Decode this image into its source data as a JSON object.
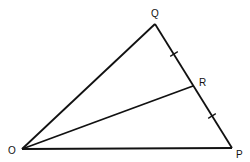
{
  "diagram": {
    "type": "geometry-triangle",
    "colors": {
      "stroke": "#111111",
      "background": "#ffffff"
    },
    "points": {
      "O": {
        "label": "O",
        "x": 22,
        "y": 149,
        "label_x": 8,
        "label_y": 154
      },
      "P": {
        "label": "P",
        "x": 232,
        "y": 148,
        "label_x": 236,
        "label_y": 158
      },
      "Q": {
        "label": "Q",
        "x": 155,
        "y": 24,
        "label_x": 151,
        "label_y": 17
      },
      "R": {
        "label": "R",
        "x": 193,
        "y": 86,
        "label_x": 199,
        "label_y": 86
      }
    },
    "segments": [
      {
        "from": "O",
        "to": "Q"
      },
      {
        "from": "Q",
        "to": "P"
      },
      {
        "from": "O",
        "to": "P"
      },
      {
        "from": "O",
        "to": "R"
      }
    ],
    "tick_marks": [
      {
        "on_segment": "QR",
        "x": 174,
        "y": 54,
        "meaning": "equal length"
      },
      {
        "on_segment": "RP",
        "x": 212,
        "y": 116,
        "meaning": "equal length"
      }
    ],
    "annotation": "QR = RP (R is midpoint of QP)"
  }
}
